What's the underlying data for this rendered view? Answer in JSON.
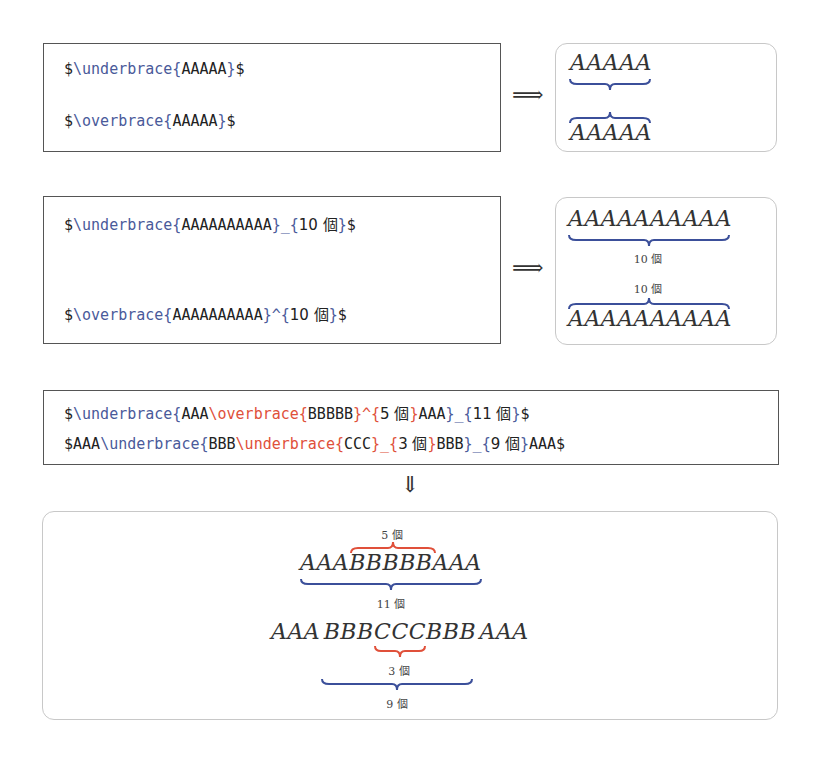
{
  "colors": {
    "blue": "#4a5a9a",
    "red": "#e0503a",
    "text": "#222222",
    "brace_blue": "#3b4f9a",
    "brace_red": "#e0503a"
  },
  "example1": {
    "code": {
      "line1": {
        "prefix": "$",
        "cmd": "\\underbrace{",
        "arg": "AAAAA",
        "close": "}",
        "suffix": "$"
      },
      "line2": {
        "prefix": "$",
        "cmd": "\\overbrace{",
        "arg": "AAAAA",
        "close": "}",
        "suffix": "$"
      }
    },
    "arrow": "⟹",
    "result": {
      "under_text": "AAAAA",
      "over_text": "AAAAA"
    }
  },
  "example2": {
    "code": {
      "line1": {
        "prefix": "$",
        "cmd": "\\underbrace{",
        "arg": "AAAAAAAAAA",
        "tail": "}_{",
        "label": "10 個",
        "close": "}",
        "suffix": "$"
      },
      "line2": {
        "prefix": "$",
        "cmd": "\\overbrace{",
        "arg": "AAAAAAAAAA",
        "tail": "}^{",
        "label": "10 個",
        "close": "}",
        "suffix": "$"
      }
    },
    "arrow": "⟹",
    "result": {
      "under_text": "AAAAAAAAAA",
      "under_label": "10 個",
      "over_label": "10 個",
      "over_text": "AAAAAAAAAA"
    }
  },
  "example3": {
    "code": {
      "line1": {
        "p1": "$",
        "c1": "\\underbrace{",
        "t1": "AAA",
        "c2": "\\overbrace{",
        "t2": "BBBBB",
        "c3": "}^{",
        "t3": "5 個",
        "c4": "}",
        "t4": "AAA",
        "c5": "}_{",
        "t5": "11 個",
        "c6": "}",
        "s": "$"
      },
      "line2": {
        "p1": "$AAA",
        "c1": "\\underbrace{",
        "t1": "BBB",
        "c2": "\\underbrace{",
        "t2": "CCC",
        "c3": "}_{",
        "t3": "3 個",
        "c4": "}",
        "t4": "BBB",
        "c5": "}_{",
        "t5": "9 個",
        "c6": "}",
        "s": "AAA$"
      }
    },
    "arrow": "⇓",
    "result": {
      "row1_text": "AAABBBBBAAA",
      "row1_over_label": "5 個",
      "row1_under_label": "11 個",
      "row2_text": "AAA BBBCCCBBB AAA",
      "row2_inner_label": "3 個",
      "row2_outer_label": "9 個"
    }
  }
}
